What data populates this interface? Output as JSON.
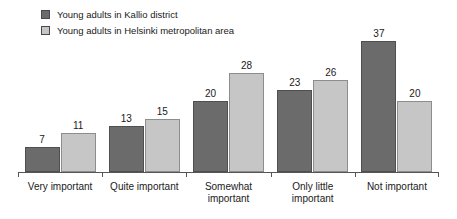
{
  "chart_data": {
    "type": "bar",
    "title": "",
    "subtitle": "",
    "xlabel": "",
    "ylabel": "",
    "ylim": [
      0,
      40
    ],
    "grid": false,
    "legend_position": "top-left",
    "orientation": "vertical",
    "grouping": "grouped",
    "categories": [
      "Very important",
      "Quite important",
      "Somewhat important",
      "Only little important",
      "Not important"
    ],
    "category_lines": [
      [
        "Very important"
      ],
      [
        "Quite important"
      ],
      [
        "Somewhat",
        "important"
      ],
      [
        "Only little",
        "important"
      ],
      [
        "Not important"
      ]
    ],
    "series": [
      {
        "name": "Young adults in Kallio district",
        "color": "#6b6b6b",
        "values": [
          7,
          13,
          20,
          23,
          37
        ]
      },
      {
        "name": "Young adults in Helsinki metropolitan area",
        "color": "#c6c6c6",
        "values": [
          11,
          15,
          28,
          26,
          20
        ]
      }
    ],
    "data_labels_shown": true,
    "axis_color": "#555555"
  },
  "legend": {
    "items": [
      {
        "label": "Young adults in Kallio district",
        "swatch": "#6b6b6b"
      },
      {
        "label": "Young adults in Helsinki metropolitan area",
        "swatch": "#c6c6c6"
      }
    ]
  }
}
